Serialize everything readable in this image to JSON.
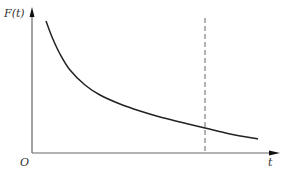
{
  "chart_data": {
    "type": "line",
    "title": "",
    "xlabel": "t",
    "ylabel": "F(t)",
    "origin_label": "O",
    "grid": false,
    "legend": null,
    "series": [
      {
        "name": "F(t)",
        "style": "solid",
        "color": "#222222",
        "points_px": [
          [
            46,
            21
          ],
          [
            52,
            37
          ],
          [
            60,
            54
          ],
          [
            70,
            70
          ],
          [
            85,
            85
          ],
          [
            100,
            95
          ],
          [
            120,
            104
          ],
          [
            140,
            111
          ],
          [
            160,
            117
          ],
          [
            180,
            122
          ],
          [
            205,
            128
          ],
          [
            230,
            134
          ],
          [
            258,
            139
          ]
        ]
      }
    ],
    "reference_line": {
      "orientation": "vertical",
      "style": "dashed",
      "color": "#555555",
      "x_px": 205,
      "y_top_px": 18,
      "y_bottom_px": 153
    },
    "axes": {
      "x_axis": {
        "from_px": [
          32,
          153
        ],
        "to_px": [
          279,
          153
        ],
        "arrow": true
      },
      "y_axis": {
        "from_px": [
          32,
          153
        ],
        "to_px": [
          32,
          8
        ],
        "arrow": true
      }
    },
    "ticks": {
      "x": [],
      "y": []
    }
  }
}
